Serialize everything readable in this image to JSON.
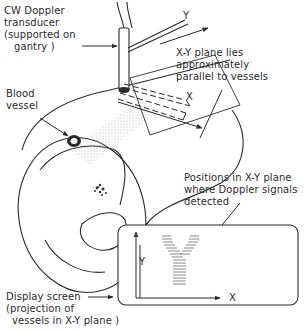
{
  "labels": {
    "transducer": [
      "CW Doppler",
      "transducer",
      "(supported on",
      "gantry )"
    ],
    "blood_vessel": [
      "Blood",
      "vessel"
    ],
    "plane": [
      "X-Y plane lies",
      "approximately",
      "parallel to vessels"
    ],
    "positions": [
      "Positions in X-Y plane",
      "where Doppler signals",
      "detected"
    ],
    "display": [
      "Display screen",
      "(projection of",
      "vessels in X-Y plane )"
    ]
  },
  "axes": {
    "scan_y": "Y",
    "scan_x": "X",
    "screen_y": "Y",
    "screen_x": "X"
  },
  "colors": {
    "line": "#2a2a2a",
    "shade": "#8a8a8a"
  }
}
